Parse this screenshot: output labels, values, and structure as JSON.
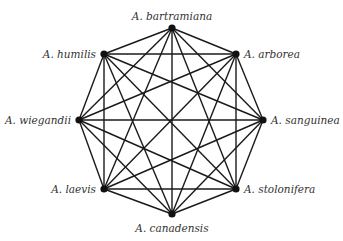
{
  "diagram": {
    "type": "complete-graph",
    "colors": {
      "edge": "#1a1a1a",
      "node": "#111111",
      "label": "#333333"
    },
    "nodes": [
      {
        "id": "bartramiana",
        "label": "A. bartramiana",
        "x": 172,
        "y": 28,
        "label_x": 140,
        "label_y": 10,
        "align": "center"
      },
      {
        "id": "arborea",
        "label": "A. arborea",
        "x": 236,
        "y": 54,
        "label_x": 244,
        "label_y": 48,
        "align": "left"
      },
      {
        "id": "sanguinea",
        "label": "A. sanguinea",
        "x": 263,
        "y": 120,
        "label_x": 272,
        "label_y": 114,
        "align": "left"
      },
      {
        "id": "stolonifera",
        "label": "A. stolonifera",
        "x": 236,
        "y": 189,
        "label_x": 244,
        "label_y": 183,
        "align": "left"
      },
      {
        "id": "canadensis",
        "label": "A. canadensis",
        "x": 172,
        "y": 214,
        "label_x": 142,
        "label_y": 222,
        "align": "center"
      },
      {
        "id": "laevis",
        "label": "A. laevis",
        "x": 104,
        "y": 189,
        "label_x": 52,
        "label_y": 183,
        "align": "right"
      },
      {
        "id": "wiegandii",
        "label": "A. wiegandii",
        "x": 79,
        "y": 120,
        "label_x": 8,
        "label_y": 114,
        "align": "right"
      },
      {
        "id": "humilis",
        "label": "A. humilis",
        "x": 104,
        "y": 54,
        "label_x": 47,
        "label_y": 48,
        "align": "right"
      }
    ],
    "edges": "all-pairs"
  }
}
